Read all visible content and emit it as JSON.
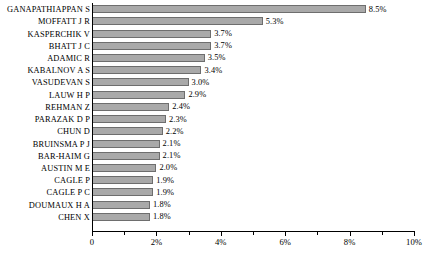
{
  "chart_data": {
    "type": "bar",
    "orientation": "horizontal",
    "title": "",
    "subtitle": "",
    "xlabel": "",
    "ylabel": "",
    "xlim": [
      0,
      10
    ],
    "grid": false,
    "legend": null,
    "axis": {
      "tick_labels": [
        "0",
        "2%",
        "4%",
        "6%",
        "8%",
        "10%"
      ],
      "tick_values": [
        0,
        2,
        4,
        6,
        8,
        10
      ],
      "minor_tick_values": [
        1,
        3,
        5,
        7,
        9
      ]
    },
    "categories": [
      "GANAPATHIAPPAN S",
      "MOFFATT J R",
      "KASPERCHIK V",
      "BHATT J C",
      "ADAMIC R",
      "KABALNOV A S",
      "VASUDEVAN S",
      "LAUW H P",
      "REHMAN Z",
      "PARAZAK D P",
      "CHUN D",
      "BRUINSMA P J",
      "BAR-HAIM G",
      "AUSTIN M E",
      "CAGLE P",
      "CAGLE P C",
      "DOUMAUX H A",
      "CHEN X"
    ],
    "values": [
      8.5,
      5.3,
      3.7,
      3.7,
      3.5,
      3.4,
      3.0,
      2.9,
      2.4,
      2.3,
      2.2,
      2.1,
      2.1,
      2.0,
      1.9,
      1.9,
      1.8,
      1.8
    ],
    "value_labels": [
      "8.5%",
      "5.3%",
      "3.7%",
      "3.7%",
      "3.5%",
      "3.4%",
      "3.0%",
      "2.9%",
      "2.4%",
      "2.3%",
      "2.2%",
      "2.1%",
      "2.1%",
      "2.0%",
      "1.9%",
      "1.9%",
      "1.8%",
      "1.8%"
    ],
    "colors": {
      "bar_fill": "#a9a9a9",
      "bar_border": "#6e6e6e",
      "axis": "#000000",
      "background": "#ffffff",
      "text": "#000000"
    }
  }
}
